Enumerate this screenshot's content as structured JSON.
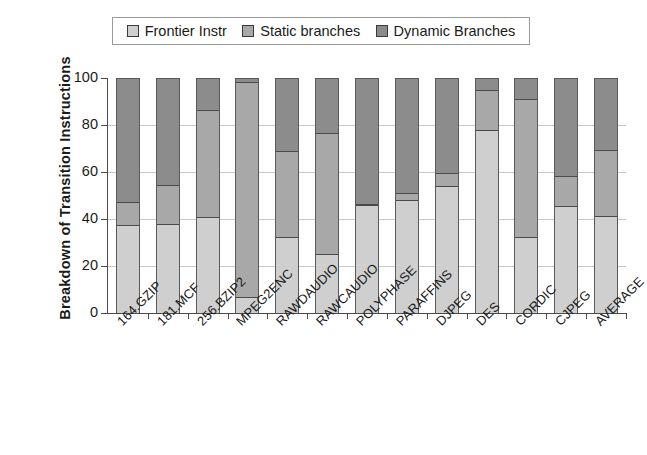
{
  "chart_data": {
    "type": "bar",
    "subtype": "stacked-bar",
    "title": "",
    "xlabel": "",
    "ylabel": "Breakdown of Transition Instructions",
    "ylim": [
      0,
      100
    ],
    "yticks": [
      0,
      20,
      40,
      60,
      80,
      100
    ],
    "grid": true,
    "legend_position": "top",
    "categories": [
      "164.GZIP",
      "181.MCF",
      "256.BZIP2",
      "MPEG2ENC",
      "RAWDAUDIO",
      "RAWCAUDIO",
      "POLYPHASE",
      "PARAFFINS",
      "DJPEG",
      "DES",
      "CORDIC",
      "CJPEG",
      "AVERAGE"
    ],
    "series": [
      {
        "name": "Frontier Instr",
        "color": "#cfcfcf",
        "values": [
          37,
          37.5,
          40.5,
          6.5,
          32,
          24.5,
          45.5,
          47.5,
          53.5,
          77.5,
          32,
          45,
          41
        ]
      },
      {
        "name": "Static branches",
        "color": "#a8a8a8",
        "values": [
          10,
          16.5,
          45.5,
          91.5,
          36.5,
          51.5,
          0.5,
          3,
          5.5,
          17,
          58.5,
          13,
          28
        ]
      },
      {
        "name": "Dynamic Branches",
        "color": "#8c8c8c",
        "values": [
          53,
          46,
          14,
          2,
          31.5,
          24,
          54,
          49.5,
          41,
          5.5,
          9.5,
          42,
          31
        ]
      }
    ]
  },
  "legend": {
    "entries": [
      {
        "label": "Frontier Instr",
        "swatch_color": "#cfcfcf"
      },
      {
        "label": "Static branches",
        "swatch_color": "#a8a8a8"
      },
      {
        "label": "Dynamic Branches",
        "swatch_color": "#8c8c8c"
      }
    ]
  },
  "axes": {
    "y_title": "Breakdown of Transition Instructions",
    "y_tick_labels": [
      "100",
      "80",
      "60",
      "40",
      "20",
      "0"
    ]
  }
}
